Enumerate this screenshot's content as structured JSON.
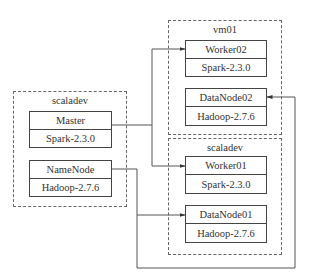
{
  "diagram": {
    "groups": [
      {
        "id": "left-scaladev",
        "label": "scaladev",
        "nodes": [
          {
            "id": "master",
            "role": "Master",
            "software": "Spark-2.3.0"
          },
          {
            "id": "namenode",
            "role": "NameNode",
            "software": "Hadoop-2.7.6"
          }
        ]
      },
      {
        "id": "vm01",
        "label": "vm01",
        "nodes": [
          {
            "id": "worker02",
            "role": "Worker02",
            "software": "Spark-2.3.0"
          },
          {
            "id": "datanode02",
            "role": "DataNode02",
            "software": "Hadoop-2.7.6"
          }
        ]
      },
      {
        "id": "right-scaladev",
        "label": "scaladev",
        "nodes": [
          {
            "id": "worker01",
            "role": "Worker01",
            "software": "Spark-2.3.0"
          },
          {
            "id": "datanode01",
            "role": "DataNode01",
            "software": "Hadoop-2.7.6"
          }
        ]
      }
    ],
    "edges": [
      {
        "from": "Master",
        "to": "Worker02"
      },
      {
        "from": "Master",
        "to": "Worker01"
      },
      {
        "from": "NameNode",
        "to": "DataNode01"
      },
      {
        "from": "NameNode",
        "to": "DataNode02"
      }
    ],
    "colors": {
      "line": "#444444",
      "dashed": "#666666",
      "text": "#333333"
    }
  }
}
